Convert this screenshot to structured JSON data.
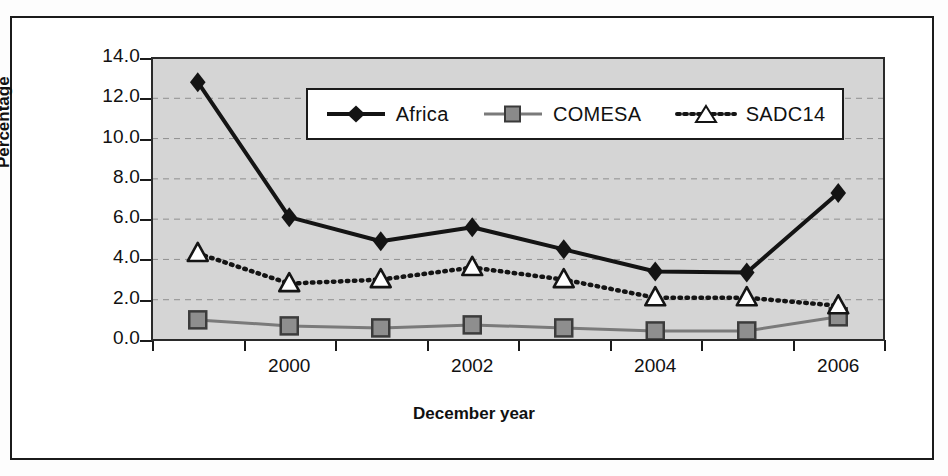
{
  "chart_data": {
    "type": "line",
    "title": "",
    "xlabel": "December year",
    "ylabel": "Percentage",
    "categories": [
      "1999",
      "2000",
      "2001",
      "2002",
      "2003",
      "2004",
      "2005",
      "2006"
    ],
    "x_tick_labels": [
      "2000",
      "2002",
      "2004",
      "2006"
    ],
    "x_tick_label_categories": [
      1,
      3,
      5,
      7
    ],
    "y_tick_labels": [
      "0.0",
      "2.0",
      "4.0",
      "6.0",
      "8.0",
      "10.0",
      "12.0",
      "14.0"
    ],
    "y_tick_values": [
      0.0,
      2.0,
      4.0,
      6.0,
      8.0,
      10.0,
      12.0,
      14.0
    ],
    "ylim": [
      0.0,
      14.0
    ],
    "grid": "horizontal-dashed",
    "legend_position": "inside-top-center",
    "plot_background": "#d5d5d5",
    "series": [
      {
        "name": "Africa",
        "marker": "filled-diamond",
        "color": "#141414",
        "line_style": "solid",
        "values": [
          12.8,
          6.1,
          4.9,
          5.6,
          4.5,
          3.4,
          3.35,
          7.3
        ]
      },
      {
        "name": "COMESA",
        "marker": "filled-square",
        "color": "#6e6e6e",
        "line_style": "solid",
        "values": [
          1.0,
          0.7,
          0.6,
          0.75,
          0.6,
          0.45,
          0.45,
          1.15
        ]
      },
      {
        "name": "SADC14",
        "marker": "open-triangle",
        "color": "#141414",
        "line_style": "dotted",
        "values": [
          4.3,
          2.8,
          3.0,
          3.6,
          3.0,
          2.1,
          2.1,
          1.7
        ]
      }
    ]
  },
  "legend": {
    "items": [
      {
        "label": "Africa"
      },
      {
        "label": "COMESA"
      },
      {
        "label": "SADC14"
      }
    ]
  },
  "axes": {
    "y_title": "Percentage",
    "x_title": "December year"
  }
}
